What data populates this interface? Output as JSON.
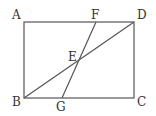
{
  "diagram": {
    "type": "geometry",
    "shape": "rectangle ABCD with diagonal BD and segment FG intersecting at E",
    "points": {
      "A": {
        "label": "A",
        "x": 24,
        "y": 22
      },
      "B": {
        "label": "B",
        "x": 24,
        "y": 98
      },
      "C": {
        "label": "C",
        "x": 134,
        "y": 98
      },
      "D": {
        "label": "D",
        "x": 134,
        "y": 22
      },
      "E": {
        "label": "E",
        "x": 78,
        "y": 60
      },
      "F": {
        "label": "F",
        "x": 96,
        "y": 22
      },
      "G": {
        "label": "G",
        "x": 62,
        "y": 98
      }
    },
    "segments": [
      "AB",
      "BC",
      "CD",
      "DA",
      "BD",
      "FG"
    ]
  }
}
